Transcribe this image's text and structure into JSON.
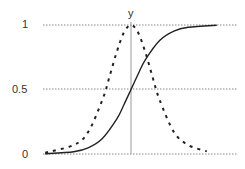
{
  "chart_data": {
    "type": "line",
    "title": "",
    "xlabel": "",
    "ylabel": "y",
    "ylim": [
      0,
      1
    ],
    "yticks": [
      0,
      0.5,
      1
    ],
    "ytick_labels": [
      "0",
      "0.5",
      "1"
    ],
    "xlim": [
      -6,
      6
    ],
    "grid": "horizontal dotted at y ticks",
    "legend": "none",
    "vertical_axis_at_x": 0,
    "series": [
      {
        "name": "sigmoid",
        "style": "solid",
        "color": "#222222",
        "x": [
          -6,
          -4,
          -3,
          -2,
          -1,
          -0.5,
          0,
          0.5,
          1,
          2,
          3,
          4,
          6
        ],
        "values": [
          0.002,
          0.018,
          0.047,
          0.12,
          0.27,
          0.38,
          0.5,
          0.62,
          0.73,
          0.88,
          0.953,
          0.982,
          0.998
        ]
      },
      {
        "name": "bell (scaled derivative)",
        "style": "dashed",
        "color": "#222222",
        "x": [
          -6,
          -4,
          -3,
          -2,
          -1.5,
          -1,
          -0.5,
          0,
          0.5,
          1,
          1.5,
          2,
          3,
          4,
          5.3
        ],
        "values": [
          0.01,
          0.07,
          0.17,
          0.42,
          0.6,
          0.79,
          0.94,
          1.0,
          0.94,
          0.79,
          0.6,
          0.42,
          0.17,
          0.07,
          0.02
        ]
      }
    ]
  },
  "labels": {
    "y_axis_title": "y",
    "tick_1": "1",
    "tick_05": "0.5",
    "tick_0": "0"
  },
  "colors": {
    "gridline": "#888888",
    "axis": "#999999",
    "curve": "#222222",
    "text": "#333333"
  }
}
